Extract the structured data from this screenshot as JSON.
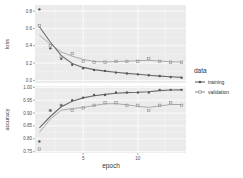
{
  "chart_data": {
    "type": "line",
    "facets": [
      "loss",
      "accuracy"
    ],
    "x": [
      1,
      2,
      3,
      4,
      5,
      6,
      7,
      8,
      9,
      10,
      11,
      12,
      13,
      14
    ],
    "xlabel": "epoch",
    "xticks": [
      5,
      10
    ],
    "xlim": [
      0.6,
      14.4
    ],
    "legend": {
      "title": "data",
      "position": "right",
      "entries": [
        "training",
        "validation"
      ]
    },
    "grid": true,
    "panels": [
      {
        "name": "loss",
        "ylabel": "loss",
        "ylim": [
          -0.03,
          0.87
        ],
        "yticks": [
          0.0,
          0.2,
          0.4,
          0.6,
          0.8
        ],
        "ytick_labels": [
          "0.0",
          "0.2",
          "0.4",
          "0.6",
          "0.8"
        ],
        "series": [
          {
            "name": "training",
            "values": [
              0.82,
              0.37,
              0.25,
              0.18,
              0.14,
              0.12,
              0.11,
              0.09,
              0.08,
              0.07,
              0.06,
              0.05,
              0.04,
              0.03
            ]
          },
          {
            "name": "validation",
            "values": [
              0.63,
              0.4,
              0.27,
              0.31,
              0.22,
              0.21,
              0.21,
              0.22,
              0.22,
              0.22,
              0.25,
              0.22,
              0.21,
              0.21
            ]
          }
        ]
      },
      {
        "name": "accuracy",
        "ylabel": "accuracy",
        "ylim": [
          0.745,
          1.005
        ],
        "yticks": [
          0.75,
          0.8,
          0.85,
          0.9,
          0.95,
          1.0
        ],
        "ytick_labels": [
          "0.75",
          "0.80",
          "0.85",
          "0.90",
          "0.95",
          "1.00"
        ],
        "series": [
          {
            "name": "training",
            "values": [
              0.79,
              0.91,
              0.93,
              0.95,
              0.96,
              0.97,
              0.97,
              0.98,
              0.98,
              0.98,
              0.98,
              0.99,
              0.99,
              0.99
            ]
          },
          {
            "name": "validation",
            "values": [
              0.76,
              0.91,
              0.93,
              0.91,
              0.92,
              0.93,
              0.94,
              0.94,
              0.93,
              0.93,
              0.91,
              0.93,
              0.94,
              0.93
            ]
          }
        ]
      }
    ]
  },
  "colors": {
    "panel_bg": "#ebebeb",
    "grid_major": "#ffffff",
    "grid_minor": "#f4f4f4",
    "training": "#555555",
    "validation": "#8a8a8a",
    "text": "#4d4d4d"
  }
}
